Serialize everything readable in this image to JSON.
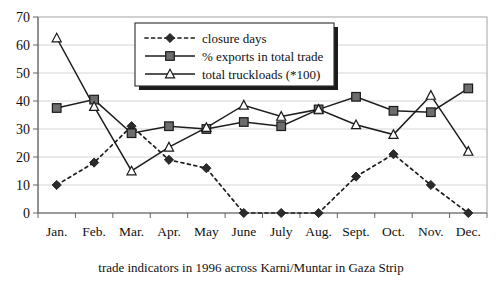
{
  "chart_data": {
    "type": "line",
    "title": "",
    "caption": "trade indicators in 1996 across Karni/Muntar in Gaza Strip",
    "xlabel": "",
    "ylabel": "",
    "ylim": [
      0,
      70
    ],
    "yticks": [
      0,
      10,
      20,
      30,
      40,
      50,
      60,
      70
    ],
    "grid": true,
    "legend_position": "top-center",
    "categories": [
      "Jan.",
      "Feb.",
      "Mar.",
      "Apr.",
      "May",
      "June",
      "July",
      "Aug.",
      "Sept.",
      "Oct.",
      "Nov.",
      "Dec."
    ],
    "series": [
      {
        "name": "closure days",
        "marker": "diamond-filled",
        "line_style": "dotted",
        "color": "#2b2b2b",
        "values": [
          10,
          18,
          31,
          19,
          16,
          0,
          0,
          0,
          13,
          21,
          10,
          0
        ]
      },
      {
        "name": "% exports in total trade",
        "marker": "square-filled",
        "line_style": "solid",
        "color": "#6d6d6d",
        "values": [
          37.5,
          40.5,
          28.5,
          31,
          30,
          32.5,
          31,
          37,
          41.5,
          36.5,
          36,
          44.5
        ]
      },
      {
        "name": "total truckloads (*100)",
        "marker": "triangle-open",
        "line_style": "solid",
        "color": "#ffffff",
        "values": [
          62.5,
          38,
          15,
          23.5,
          30.5,
          38.5,
          34.5,
          37,
          31.5,
          28,
          42,
          22
        ]
      }
    ]
  },
  "legend": {
    "items": [
      {
        "label": "closure days"
      },
      {
        "label": "% exports in total trade"
      },
      {
        "label": "total truckloads (*100)"
      }
    ]
  },
  "axes": {
    "y_tick_labels": [
      "70",
      "60",
      "50",
      "40",
      "30",
      "20",
      "10",
      "0"
    ],
    "x_tick_labels": [
      "Jan.",
      "Feb.",
      "Mar.",
      "Apr.",
      "May",
      "June",
      "July",
      "Aug.",
      "Sept.",
      "Oct.",
      "Nov.",
      "Dec."
    ]
  },
  "caption": {
    "text": "trade indicators in 1996 across Karni/Muntar in Gaza Strip"
  }
}
